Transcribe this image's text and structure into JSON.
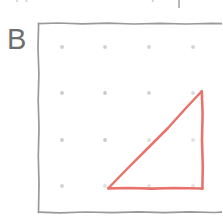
{
  "page": {
    "width": 222,
    "height": 224,
    "background_color": "#ffffff"
  },
  "top_partial_text": {
    "text": "opposite sides are parallel",
    "note": "bottom sliver of a cut-off line of text at the very top of the crop",
    "color": "#c9c9c9"
  },
  "figure": {
    "label": "B",
    "label_color": "#6e6e6e",
    "frame": {
      "name": "geoboard-frame",
      "style": "hand-drawn square outline, cropped at right edge",
      "color": "#9a9a9a",
      "stroke_width": 1.6,
      "left": 38,
      "top": 23,
      "right": 228,
      "bottom": 212
    },
    "grid": {
      "name": "peg-dot-grid",
      "rows": 4,
      "columns": 4,
      "dot_color": "#cfcfcf",
      "dot_radius": 1.8,
      "x_positions": [
        62,
        105,
        149,
        193
      ],
      "y_positions": [
        47,
        93,
        140,
        186
      ]
    },
    "shape": {
      "name": "right-triangle",
      "type": "triangle",
      "color": "#e8736c",
      "stroke_width": 2.4,
      "vertices": [
        {
          "label": "apex",
          "x": 202,
          "y": 91
        },
        {
          "label": "bottom-right",
          "x": 203,
          "y": 188
        },
        {
          "label": "bottom-left",
          "x": 108,
          "y": 188
        }
      ],
      "right_angle_at": "bottom-right"
    }
  }
}
